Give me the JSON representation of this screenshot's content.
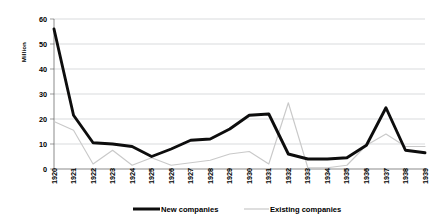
{
  "chart_data": {
    "type": "line",
    "title": "",
    "xlabel": "",
    "ylabel": "Million",
    "ylim": [
      0,
      60
    ],
    "yticks": [
      0,
      10,
      20,
      30,
      40,
      50,
      60
    ],
    "grid": true,
    "legend_position": "bottom",
    "categories": [
      "1920",
      "1921",
      "1922",
      "1923",
      "1924",
      "1925",
      "1926",
      "1927",
      "1928",
      "1929",
      "1930",
      "1931",
      "1932",
      "1933",
      "1934",
      "1935",
      "1936",
      "1937",
      "1938",
      "1939"
    ],
    "series": [
      {
        "name": "New companies",
        "color": "#0d0d0d",
        "style": "thick-solid",
        "values": [
          56,
          21.5,
          10.5,
          10,
          9,
          5,
          8,
          11.5,
          12,
          16,
          21.5,
          22,
          6,
          4,
          4,
          4.5,
          9.5,
          24.5,
          7.5,
          6.5
        ]
      },
      {
        "name": "Existing companies",
        "color": "#c9c9c9",
        "style": "thin-solid",
        "values": [
          19,
          15.5,
          2,
          7.5,
          1.5,
          4.5,
          1.5,
          2.5,
          3.5,
          6,
          7,
          2,
          26.5,
          0.5,
          0.5,
          1.5,
          9.5,
          14,
          9,
          9
        ]
      }
    ]
  },
  "axis": {
    "y_title": "Million"
  },
  "legend": {
    "items": [
      {
        "label": "New companies"
      },
      {
        "label": "Existing companies"
      }
    ]
  }
}
